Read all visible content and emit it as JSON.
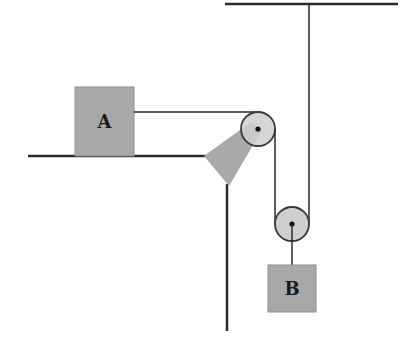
{
  "diagram": {
    "title": "",
    "type": "pulley-system",
    "colors": {
      "line": "#2a2a2a",
      "block_fill": "#a8a8a8",
      "block_stroke": "#8a8a8a",
      "pulley_fill": "#cfcfcf",
      "bracket_fill": "#a9a9a9",
      "background": "#ffffff"
    },
    "blocks": [
      {
        "id": "A",
        "label": "A"
      },
      {
        "id": "B",
        "label": "B"
      }
    ],
    "components": [
      "table-surface",
      "ceiling",
      "fixed-pulley",
      "movable-pulley",
      "pulley-bracket",
      "vertical-support",
      "rope"
    ]
  }
}
